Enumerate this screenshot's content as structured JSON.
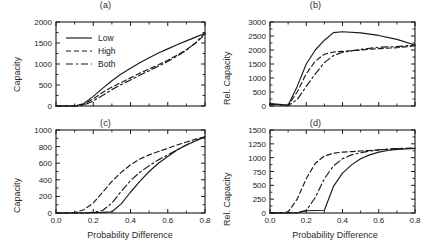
{
  "figure": {
    "panels": [
      {
        "key": "a",
        "title": "(a)",
        "ylabel": "Capacity",
        "xlabel": "",
        "yticks": [
          "0",
          "500",
          "1000",
          "1500",
          "2000"
        ],
        "xticks": [
          "",
          "",
          "",
          "",
          ""
        ],
        "legend": [
          {
            "label": "Low",
            "style": "solid"
          },
          {
            "label": "High",
            "style": "dashed"
          },
          {
            "label": "Both",
            "style": "dashdot"
          }
        ]
      },
      {
        "key": "b",
        "title": "(b)",
        "ylabel": "Rel. Capacity",
        "xlabel": "",
        "yticks": [
          "0",
          "500",
          "1000",
          "1500",
          "2000",
          "2500",
          "3000"
        ],
        "xticks": [
          "",
          "",
          "",
          "",
          ""
        ],
        "legend": []
      },
      {
        "key": "c",
        "title": "(c)",
        "ylabel": "Capacity",
        "xlabel": "Probability Difference",
        "yticks": [
          "0",
          "200",
          "400",
          "600",
          "800",
          "1000"
        ],
        "xticks": [
          "0.0",
          "0.2",
          "0.4",
          "0.6",
          "0.8"
        ],
        "legend": []
      },
      {
        "key": "d",
        "title": "(d)",
        "ylabel": "Rel. Capacity",
        "xlabel": "Probability Difference",
        "yticks": [
          "0",
          "250",
          "500",
          "750",
          "1000",
          "1250",
          "1500"
        ],
        "xticks": [
          "0.0",
          "0.2",
          "0.4",
          "0.6",
          "0.8"
        ],
        "legend": []
      }
    ],
    "colors": {
      "line": "#1a1a1a",
      "axis": "#1a1a1a",
      "background": "#ffffff"
    }
  },
  "chart_data": [
    {
      "type": "line",
      "panel": "a",
      "title": "(a)",
      "xlabel": "",
      "ylabel": "Capacity",
      "xlim": [
        0.0,
        0.8
      ],
      "ylim": [
        0,
        2000
      ],
      "xticks": [
        0.0,
        0.2,
        0.4,
        0.6,
        0.8
      ],
      "yticks": [
        0,
        500,
        1000,
        1500,
        2000
      ],
      "grid": false,
      "legend_position": "upper-left",
      "x": [
        0.0,
        0.05,
        0.1,
        0.15,
        0.2,
        0.25,
        0.3,
        0.35,
        0.4,
        0.45,
        0.5,
        0.55,
        0.6,
        0.65,
        0.7,
        0.75,
        0.8
      ],
      "series": [
        {
          "name": "Low",
          "style": "solid",
          "values": [
            0,
            0,
            0,
            60,
            230,
            420,
            600,
            760,
            900,
            1030,
            1150,
            1260,
            1360,
            1460,
            1550,
            1640,
            1730
          ]
        },
        {
          "name": "High",
          "style": "dashed",
          "values": [
            0,
            0,
            0,
            40,
            170,
            320,
            450,
            560,
            670,
            780,
            880,
            980,
            1090,
            1210,
            1340,
            1500,
            1700
          ]
        },
        {
          "name": "Both",
          "style": "dashdot",
          "values": [
            0,
            0,
            0,
            20,
            120,
            250,
            390,
            510,
            620,
            730,
            840,
            950,
            1060,
            1190,
            1330,
            1510,
            1730
          ]
        }
      ]
    },
    {
      "type": "line",
      "panel": "b",
      "title": "(b)",
      "xlabel": "",
      "ylabel": "Rel. Capacity",
      "xlim": [
        0.0,
        0.8
      ],
      "ylim": [
        0,
        3000
      ],
      "xticks": [
        0.0,
        0.2,
        0.4,
        0.6,
        0.8
      ],
      "yticks": [
        0,
        500,
        1000,
        1500,
        2000,
        2500,
        3000
      ],
      "grid": false,
      "legend_position": "none",
      "x": [
        0.0,
        0.05,
        0.1,
        0.15,
        0.2,
        0.25,
        0.3,
        0.35,
        0.4,
        0.5,
        0.6,
        0.7,
        0.8
      ],
      "series": [
        {
          "name": "Low",
          "style": "solid",
          "values": [
            90,
            60,
            30,
            700,
            1500,
            2000,
            2350,
            2620,
            2650,
            2610,
            2520,
            2380,
            2180
          ]
        },
        {
          "name": "High",
          "style": "dashed",
          "values": [
            70,
            50,
            20,
            500,
            1150,
            1600,
            1850,
            1930,
            1950,
            2000,
            2050,
            2080,
            2150
          ]
        },
        {
          "name": "Both",
          "style": "dashdot",
          "values": [
            60,
            40,
            10,
            230,
            700,
            1150,
            1550,
            1800,
            1920,
            2020,
            2100,
            2120,
            2180
          ]
        }
      ]
    },
    {
      "type": "line",
      "panel": "c",
      "title": "(c)",
      "xlabel": "Probability Difference",
      "ylabel": "Capacity",
      "xlim": [
        0.0,
        0.8
      ],
      "ylim": [
        0,
        1000
      ],
      "xticks": [
        0.0,
        0.2,
        0.4,
        0.6,
        0.8
      ],
      "yticks": [
        0,
        200,
        400,
        600,
        800,
        1000
      ],
      "grid": false,
      "legend_position": "none",
      "x": [
        0.0,
        0.05,
        0.1,
        0.15,
        0.2,
        0.25,
        0.3,
        0.35,
        0.4,
        0.45,
        0.5,
        0.55,
        0.6,
        0.65,
        0.7,
        0.75,
        0.8
      ],
      "series": [
        {
          "name": "Low",
          "style": "solid",
          "values": [
            0,
            0,
            0,
            0,
            5,
            8,
            15,
            110,
            250,
            380,
            500,
            600,
            680,
            760,
            820,
            870,
            915
          ]
        },
        {
          "name": "High",
          "style": "dashed",
          "values": [
            0,
            0,
            5,
            40,
            120,
            250,
            380,
            490,
            580,
            650,
            700,
            740,
            780,
            820,
            855,
            890,
            920
          ]
        },
        {
          "name": "Both",
          "style": "dashdot",
          "values": [
            0,
            0,
            0,
            2,
            8,
            30,
            120,
            260,
            390,
            490,
            570,
            640,
            700,
            760,
            820,
            870,
            920
          ]
        }
      ]
    },
    {
      "type": "line",
      "panel": "d",
      "title": "(d)",
      "xlabel": "Probability Difference",
      "ylabel": "Rel. Capacity",
      "xlim": [
        0.0,
        0.8
      ],
      "ylim": [
        0,
        1500
      ],
      "xticks": [
        0.0,
        0.2,
        0.4,
        0.6,
        0.8
      ],
      "yticks": [
        0,
        250,
        500,
        750,
        1000,
        1250,
        1500
      ],
      "grid": false,
      "legend_position": "none",
      "x": [
        0.0,
        0.05,
        0.1,
        0.15,
        0.2,
        0.25,
        0.3,
        0.35,
        0.4,
        0.45,
        0.5,
        0.55,
        0.6,
        0.65,
        0.7,
        0.75,
        0.8
      ],
      "series": [
        {
          "name": "Low",
          "style": "solid",
          "values": [
            0,
            0,
            0,
            0,
            40,
            45,
            50,
            480,
            720,
            870,
            980,
            1050,
            1100,
            1130,
            1150,
            1160,
            1165
          ]
        },
        {
          "name": "High",
          "style": "dashed",
          "values": [
            0,
            0,
            20,
            250,
            620,
            900,
            1030,
            1080,
            1100,
            1110,
            1120,
            1130,
            1140,
            1150,
            1160,
            1165,
            1170
          ]
        },
        {
          "name": "Both",
          "style": "dashdot",
          "values": [
            0,
            0,
            0,
            10,
            45,
            280,
            620,
            850,
            980,
            1050,
            1090,
            1120,
            1140,
            1155,
            1165,
            1170,
            1172
          ]
        }
      ]
    }
  ]
}
